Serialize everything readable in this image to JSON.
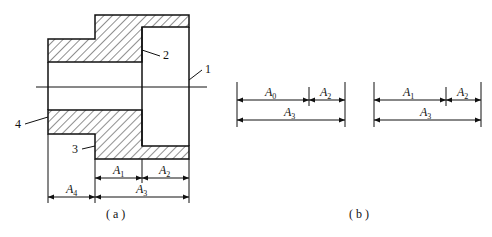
{
  "figure": {
    "part_labels": [
      "1",
      "2",
      "3",
      "4"
    ],
    "panel_a": {
      "caption": "( a )",
      "dimensions": [
        {
          "name": "A",
          "sub": "1"
        },
        {
          "name": "A",
          "sub": "2"
        },
        {
          "name": "A",
          "sub": "4"
        },
        {
          "name": "A",
          "sub": "3"
        }
      ]
    },
    "panel_b": {
      "caption": "( b )",
      "chain_left": {
        "top": [
          {
            "name": "A",
            "sub": "0"
          },
          {
            "name": "A",
            "sub": "2"
          }
        ],
        "bottom": {
          "name": "A",
          "sub": "3"
        }
      },
      "chain_right": {
        "top": [
          {
            "name": "A",
            "sub": "1"
          },
          {
            "name": "A",
            "sub": "2"
          }
        ],
        "bottom": {
          "name": "A",
          "sub": "3"
        }
      }
    }
  }
}
